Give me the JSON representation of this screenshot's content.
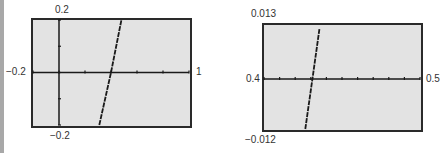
{
  "colors": {
    "frame_fill": "#e3e3e3",
    "frame_border": "#2a2a2a",
    "axis": "#1a1a1a",
    "curve": "#1a1a1a",
    "label": "#333333"
  },
  "chart_data": [
    {
      "type": "line",
      "title": "",
      "xlabel": "",
      "ylabel": "",
      "xlim": [
        -0.2,
        1
      ],
      "ylim": [
        -0.2,
        0.2
      ],
      "x_tick_step": 0.2,
      "y_tick_step": 0.1,
      "grid": false,
      "window_labels": {
        "xmin": "−0.2",
        "xmax": "1",
        "ymax": "0.2",
        "ymin": "−0.2"
      },
      "series": [
        {
          "name": "f(x)",
          "x": [
            0.31,
            0.4,
            0.48
          ],
          "y": [
            -0.2,
            0.0,
            0.2
          ]
        }
      ],
      "root_approx": 0.4
    },
    {
      "type": "line",
      "title": "",
      "xlabel": "",
      "ylabel": "",
      "xlim": [
        0.4,
        0.5
      ],
      "ylim": [
        -0.012,
        0.013
      ],
      "x_tick_step": 0.01,
      "y_tick_step": null,
      "grid": false,
      "window_labels": {
        "xmin": "0.4",
        "xmax": "0.5",
        "ymax": "0.013",
        "ymin": "−0.012"
      },
      "series": [
        {
          "name": "f(x) zoomed",
          "x": [
            0.4265,
            0.431,
            0.4355
          ],
          "y": [
            -0.012,
            0.0,
            0.012
          ]
        }
      ],
      "root_approx": 0.431
    }
  ]
}
